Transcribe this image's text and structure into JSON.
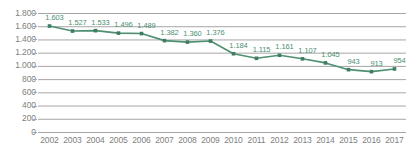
{
  "chart_data": {
    "type": "line",
    "title": "",
    "subtitle": "",
    "xlabel": "",
    "ylabel": "",
    "grid": true,
    "legend": false,
    "legend_position": "none",
    "series_color": "#4e8f72",
    "marker_color": "#3f7d61",
    "gridline_color": "#a6a6a6",
    "tick_label_color": "#808080",
    "data_label_color": "#4e8f72",
    "background_color": "#ffffff",
    "ylim": [
      0,
      1800
    ],
    "ytick_values": [
      1800,
      1600,
      1400,
      1200,
      1000,
      800,
      600,
      400,
      200,
      0
    ],
    "ytick_labels": [
      "1.800",
      "1.600",
      "1.400",
      "1.200",
      "1.000",
      "800",
      "600",
      "400",
      "200",
      "0"
    ],
    "categories": [
      "2002",
      "2003",
      "2004",
      "2005",
      "2006",
      "2007",
      "2008",
      "2009",
      "2010",
      "2011",
      "2012",
      "2013",
      "2014",
      "2015",
      "2016",
      "2017"
    ],
    "values": [
      1603,
      1527,
      1533,
      1496,
      1489,
      1382,
      1360,
      1376,
      1184,
      1115,
      1161,
      1107,
      1045,
      943,
      913,
      954
    ],
    "data_labels": [
      "1.603",
      "1.527",
      "1.533",
      "1.496",
      "1.489",
      "1.382",
      "1.360",
      "1.376",
      "1.184",
      "1.115",
      "1.161",
      "1.107",
      "1.045",
      "943",
      "913",
      "954"
    ]
  }
}
